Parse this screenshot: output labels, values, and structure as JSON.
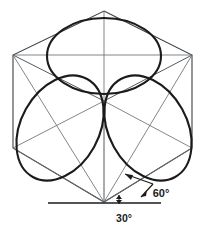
{
  "figure": {
    "background_color": "#ffffff",
    "width": 204,
    "height": 229,
    "line_color": "#1b1b1b",
    "construction_line_color": "#6b7075",
    "cube_edge_color": "#555a5e"
  },
  "annotations": {
    "angle_30": {
      "label": "30°",
      "value": 30,
      "unit": "degrees",
      "x": 124,
      "y": 219
    },
    "angle_60": {
      "label": "60°",
      "value": 60,
      "unit": "degrees",
      "x": 161,
      "y": 197
    }
  },
  "geometry": {
    "cube_vertices": {
      "top": [
        104,
        11
      ],
      "left": [
        13,
        55
      ],
      "right": [
        192,
        55
      ],
      "center": [
        104,
        101
      ],
      "bottom": [
        104,
        202
      ],
      "left_bottom": [
        13,
        148
      ],
      "right_bottom": [
        192,
        148
      ]
    },
    "ellipses": [
      {
        "face": "top",
        "cx": 104,
        "cy": 56,
        "rx": 57,
        "ry": 38,
        "rotation": 0
      },
      {
        "face": "left",
        "cx": 60,
        "cy": 128,
        "rx": 56,
        "ry": 39,
        "rotation": -61
      },
      {
        "face": "right",
        "cx": 148,
        "cy": 128,
        "rx": 56,
        "ry": 39,
        "rotation": 61
      }
    ],
    "baseline": {
      "x1": 48,
      "y1": 203,
      "x2": 161,
      "y2": 203
    }
  }
}
